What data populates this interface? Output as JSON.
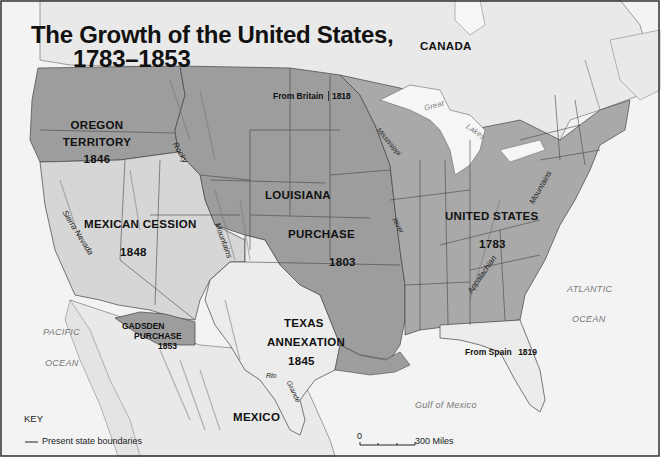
{
  "title": {
    "line1": "The Growth of the United States,",
    "line2": "1783–1853"
  },
  "colors": {
    "water": "#f3f3f3",
    "foreign_land": "#e9e9e9",
    "original_us": "#a9a9a9",
    "louisiana_purchase": "#9d9d9d",
    "oregon_territory": "#9d9d9d",
    "mexican_cession": "#d6d6d6",
    "texas_annexation": "#ececec",
    "gadsden_purchase": "#9d9d9d",
    "from_britain": "#a9a9a9",
    "from_spain": "#ececec",
    "border": "#333333"
  },
  "regions": {
    "oregon": {
      "name_line1": "OREGON",
      "name_line2": "TERRITORY",
      "year": "1846"
    },
    "mexican_cession": {
      "name": "MEXICAN CESSION",
      "year": "1848"
    },
    "louisiana": {
      "name_line1": "LOUISIANA",
      "name_line2": "PURCHASE",
      "year": "1803"
    },
    "united_states": {
      "name": "UNITED STATES",
      "year": "1783"
    },
    "texas": {
      "name_line1": "TEXAS",
      "name_line2": "ANNEXATION",
      "year": "1845"
    },
    "gadsden": {
      "name_line1": "GADSDEN",
      "name_line2": "PURCHASE",
      "year": "1853"
    },
    "from_britain": {
      "label": "From Britain",
      "year": "1818"
    },
    "from_spain": {
      "label": "From Spain",
      "year": "1819"
    }
  },
  "countries": {
    "canada": "CANADA",
    "mexico": "MEXICO"
  },
  "water_labels": {
    "pacific": "PACIFIC",
    "pacific_ocean": "OCEAN",
    "atlantic": "ATLANTIC",
    "atlantic_ocean": "OCEAN",
    "gulf": "Gulf of Mexico",
    "great": "Great",
    "lakes": "Lakes"
  },
  "features": {
    "rocky": "Rocky",
    "rocky_mountains": "Mountains",
    "sierra_nevada": "Sierra Nevada",
    "appalachian": "Appalachian",
    "appalachian_mountains": "Mountains",
    "mississippi": "Mississippi",
    "river": "River",
    "rio": "Rio",
    "grande": "Grande"
  },
  "key": {
    "title": "KEY",
    "items": [
      {
        "symbol": "line",
        "label": "Present state boundaries"
      }
    ]
  },
  "scale_bar": {
    "start": "0",
    "end": "300 Miles"
  }
}
